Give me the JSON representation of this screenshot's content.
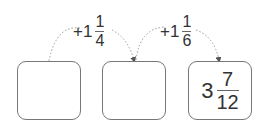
{
  "operations": [
    {
      "prefix": "+1",
      "numerator": "1",
      "denominator": "4"
    },
    {
      "prefix": "+1",
      "numerator": "1",
      "denominator": "6"
    }
  ],
  "boxes": [
    {
      "value": ""
    },
    {
      "value": ""
    },
    {
      "whole": "3",
      "numerator": "7",
      "denominator": "12"
    }
  ],
  "colors": {
    "arc": "#999999",
    "box_border": "#777777",
    "text": "#333333"
  }
}
